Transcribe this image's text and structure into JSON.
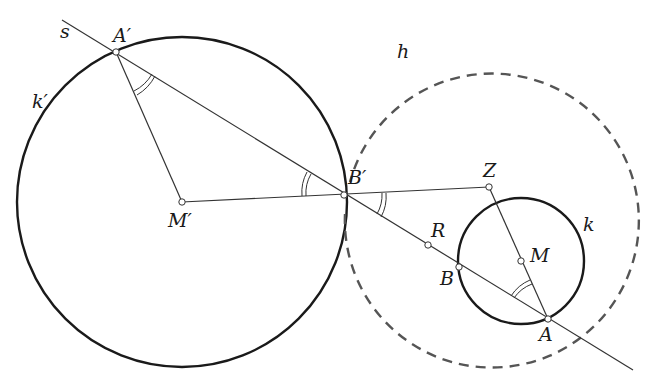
{
  "diagram": {
    "labels": {
      "s": "s",
      "A_prime": "A′",
      "k_prime": "k′",
      "M_prime": "M′",
      "B_prime": "B′",
      "Z": "Z",
      "h": "h",
      "R": "R",
      "B": "B",
      "M": "M",
      "k": "k",
      "A": "A"
    },
    "points": {
      "A_prime": [
        116,
        52
      ],
      "M_prime": [
        182,
        202
      ],
      "B_prime": [
        344,
        195
      ],
      "Z": [
        489,
        187
      ],
      "R": [
        428,
        245
      ],
      "B": [
        459,
        267
      ],
      "M": [
        521,
        261
      ],
      "A": [
        548,
        319
      ]
    },
    "circles": {
      "k_prime": {
        "center": [
          182,
          202
        ],
        "r": 165,
        "style": "solid-thick"
      },
      "k": {
        "center": [
          521,
          261
        ],
        "r": 63,
        "style": "solid-thick"
      },
      "h": {
        "center": [
          487,
          187
        ],
        "r": 147,
        "style": "dashed"
      }
    },
    "line_s": {
      "from": [
        62,
        20
      ],
      "to": [
        633,
        370
      ]
    },
    "colors": {
      "stroke": "#1a1a1a",
      "dashed": "#555555",
      "background": "#ffffff"
    }
  }
}
